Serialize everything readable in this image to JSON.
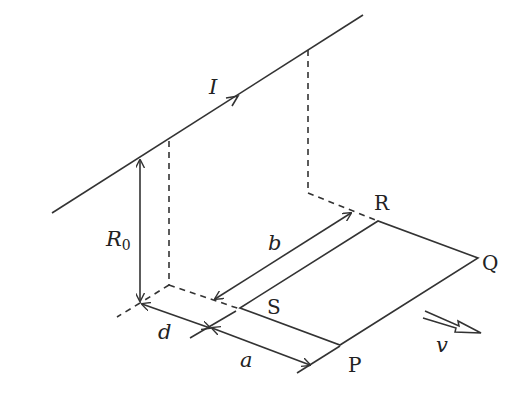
{
  "diagram": {
    "type": "physics-figure",
    "labels": {
      "current": "I",
      "height_main": "R",
      "height_sub": "0",
      "distance_d": "d",
      "side_a": "a",
      "side_b": "b",
      "vertex_P": "P",
      "vertex_Q": "Q",
      "vertex_R": "R",
      "vertex_S": "S",
      "velocity": "v"
    },
    "colors": {
      "stroke": "#333333",
      "text": "#222222",
      "background": "#ffffff"
    }
  }
}
